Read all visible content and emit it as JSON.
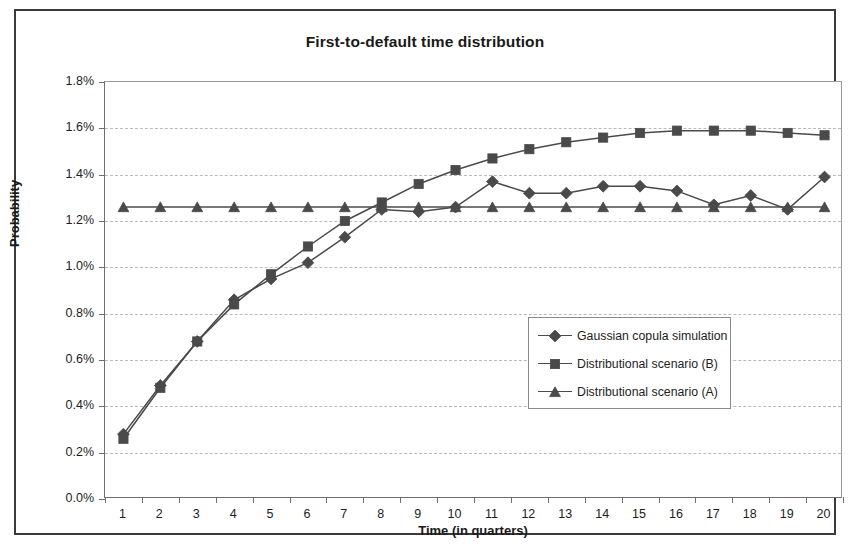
{
  "chart_data": {
    "type": "line",
    "title": "First-to-default time distribution",
    "xlabel": "Time (in quarters)",
    "ylabel": "Probability",
    "categories": [
      1,
      2,
      3,
      4,
      5,
      6,
      7,
      8,
      9,
      10,
      11,
      12,
      13,
      14,
      15,
      16,
      17,
      18,
      19,
      20
    ],
    "xtick_labels": [
      "1",
      "2",
      "3",
      "4",
      "5",
      "6",
      "7",
      "8",
      "9",
      "10",
      "11",
      "12",
      "13",
      "14",
      "15",
      "16",
      "17",
      "18",
      "19",
      "20"
    ],
    "ytick_labels": [
      "0.0%",
      "0.2%",
      "0.4%",
      "0.6%",
      "0.8%",
      "1.0%",
      "1.2%",
      "1.4%",
      "1.6%",
      "1.8%"
    ],
    "ytick_values": [
      0.0,
      0.2,
      0.4,
      0.6,
      0.8,
      1.0,
      1.2,
      1.4,
      1.6,
      1.8
    ],
    "ylim": [
      0.0,
      1.8
    ],
    "grid": "horizontal-dashed",
    "legend_position": "inside-center-right",
    "series": [
      {
        "name": "Gaussian copula simulation",
        "marker": "diamond",
        "color": "#4a4a4a",
        "values": [
          0.28,
          0.49,
          0.68,
          0.86,
          0.95,
          1.02,
          1.13,
          1.25,
          1.24,
          1.26,
          1.37,
          1.32,
          1.32,
          1.35,
          1.35,
          1.33,
          1.27,
          1.31,
          1.25,
          1.39
        ]
      },
      {
        "name": "Distributional scenario (B)",
        "marker": "square",
        "color": "#4a4a4a",
        "values": [
          0.26,
          0.48,
          0.68,
          0.84,
          0.97,
          1.09,
          1.2,
          1.28,
          1.36,
          1.42,
          1.47,
          1.51,
          1.54,
          1.56,
          1.58,
          1.59,
          1.59,
          1.59,
          1.58,
          1.57
        ]
      },
      {
        "name": "Distributional scenario (A)",
        "marker": "triangle",
        "color": "#4a4a4a",
        "values": [
          1.26,
          1.26,
          1.26,
          1.26,
          1.26,
          1.26,
          1.26,
          1.26,
          1.26,
          1.26,
          1.26,
          1.26,
          1.26,
          1.26,
          1.26,
          1.26,
          1.26,
          1.26,
          1.26,
          1.26
        ]
      }
    ]
  },
  "legend": {
    "items": [
      {
        "label": "Gaussian copula simulation"
      },
      {
        "label": "Distributional scenario (B)"
      },
      {
        "label": "Distributional scenario (A)"
      }
    ]
  },
  "colors": {
    "series_line": "#4a4a4a",
    "axis": "#6e6e6e",
    "grid": "#b9b9c4",
    "text": "#1d1d1d",
    "frame": "#3a3a3a"
  }
}
